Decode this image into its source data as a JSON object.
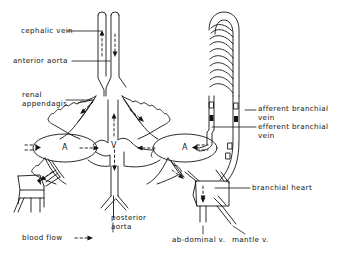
{
  "figure": {
    "type": "anatomical-schematic",
    "background_color": "#ffffff",
    "line_color": "#141414"
  },
  "labels": {
    "cephalic_vein": "cephalic vein",
    "anterior_aorta": "anterior aorta",
    "renal_appendages_line1": "renal",
    "renal_appendages_line2": "appendagis",
    "afferent_branchial_vein_line1": "afferent branchial",
    "afferent_branchial_vein_line2": "vein",
    "efferent_branchial_vein_line1": "efferent branchial",
    "efferent_branchial_vein_line2": "vein",
    "branchial_heart": "branchial heart",
    "posterior_aorta_line1": "posterior",
    "posterior_aorta_line2": "aorta",
    "abdominal_vein": "ab-dominal v.",
    "mantle_vein": "mantle v."
  },
  "organs": {
    "left_atrium": "A",
    "right_atrium": "A",
    "ventricle": "V"
  },
  "legend": {
    "blood_flow_label": "blood flow",
    "blood_flow_symbol": "- - ▶"
  }
}
